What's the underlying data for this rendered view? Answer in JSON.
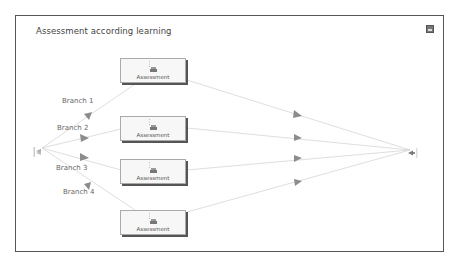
{
  "diagram": {
    "title": "Assessment according learning",
    "nodes": [
      {
        "id": "assessment-1",
        "label": "Assessment"
      },
      {
        "id": "assessment-2",
        "label": "Assessment"
      },
      {
        "id": "assessment-3",
        "label": "Assessment"
      },
      {
        "id": "assessment-4",
        "label": "Assessment"
      }
    ],
    "branches": [
      {
        "label": "Branch 1"
      },
      {
        "label": "Branch 2"
      },
      {
        "label": "Branch 3"
      },
      {
        "label": "Branch 4"
      }
    ],
    "start_node": {
      "icon": "split-gateway-icon"
    },
    "end_node": {
      "icon": "merge-gateway-icon"
    },
    "corner_icon": "maximize-icon",
    "colors": {
      "edge": "#d4d4d4",
      "arrow": "#888888",
      "frame": "#555555",
      "node_bg": "#f7f7f7"
    }
  }
}
